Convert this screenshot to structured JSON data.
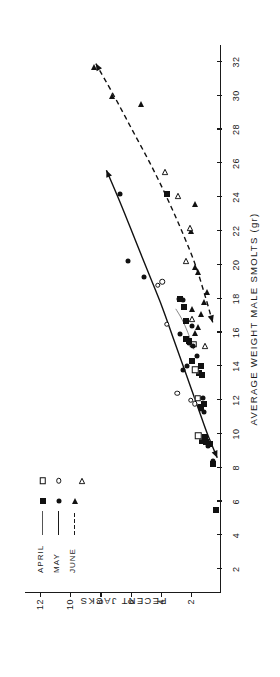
{
  "figure": {
    "y_axis": {
      "label": "PECENT JACKS",
      "ticks": [
        2,
        4,
        6,
        8,
        10,
        12
      ],
      "min": 0,
      "max": 13
    },
    "x_axis": {
      "label": "AVERAGE WEIGHT MALE SMOLTS (gr)",
      "ticks": [
        2,
        4,
        6,
        8,
        10,
        12,
        14,
        16,
        18,
        20,
        22,
        24,
        26,
        28,
        30,
        32
      ],
      "min": 0.6,
      "max": 33
    }
  },
  "legend": {
    "rows": [
      {
        "label": "APRIL",
        "line_style": "thin-solid",
        "open_marker": "open-square",
        "filled_marker": "filled-square"
      },
      {
        "label": "MAY",
        "line_style": "solid",
        "open_marker": "open-circle",
        "filled_marker": "filled-circle"
      },
      {
        "label": "JUNE",
        "line_style": "dashed",
        "open_marker": "open-triangle",
        "filled_marker": "filled-triangle"
      }
    ]
  },
  "chart_data": {
    "type": "scatter",
    "title": "",
    "xlabel": "AVERAGE WEIGHT MALE SMOLTS (gr)",
    "ylabel": "PECENT JACKS",
    "xlim": [
      0.6,
      33
    ],
    "ylim": [
      0,
      13
    ],
    "xticks": [
      2,
      4,
      6,
      8,
      10,
      12,
      14,
      16,
      18,
      20,
      22,
      24,
      26,
      28,
      30,
      32
    ],
    "yticks": [
      2,
      4,
      6,
      8,
      10,
      12
    ],
    "grid": false,
    "legend_position": "upper-left",
    "series": [
      {
        "name": "APRIL",
        "marker": "filled-square",
        "open_marker": "open-square",
        "line": "thin-solid",
        "points": [
          {
            "x": 5.5,
            "y": 0.35,
            "style": "filled-square"
          },
          {
            "x": 8.2,
            "y": 0.55,
            "style": "filled-square"
          },
          {
            "x": 9.4,
            "y": 0.75,
            "style": "filled-square"
          },
          {
            "x": 9.5,
            "y": 1.0,
            "style": "filled-square"
          },
          {
            "x": 9.6,
            "y": 1.25,
            "style": "filled-square"
          },
          {
            "x": 9.8,
            "y": 1.05,
            "style": "filled-square"
          },
          {
            "x": 9.9,
            "y": 1.5,
            "style": "open-square"
          },
          {
            "x": 11.6,
            "y": 1.35,
            "style": "filled-square"
          },
          {
            "x": 11.8,
            "y": 1.1,
            "style": "filled-square"
          },
          {
            "x": 12.1,
            "y": 1.55,
            "style": "open-square"
          },
          {
            "x": 13.5,
            "y": 1.25,
            "style": "filled-square"
          },
          {
            "x": 13.6,
            "y": 1.45,
            "style": "filled-square"
          },
          {
            "x": 13.8,
            "y": 1.7,
            "style": "open-square"
          },
          {
            "x": 14.0,
            "y": 1.3,
            "style": "filled-square"
          },
          {
            "x": 14.3,
            "y": 1.9,
            "style": "filled-square"
          },
          {
            "x": 15.3,
            "y": 1.85,
            "style": "open-square"
          },
          {
            "x": 15.5,
            "y": 2.1,
            "style": "filled-square"
          },
          {
            "x": 15.6,
            "y": 2.35,
            "style": "filled-square"
          },
          {
            "x": 16.7,
            "y": 2.35,
            "style": "filled-square"
          },
          {
            "x": 17.5,
            "y": 2.45,
            "style": "filled-square"
          },
          {
            "x": 18.0,
            "y": 2.75,
            "style": "filled-square"
          },
          {
            "x": 24.2,
            "y": 3.55,
            "style": "filled-square"
          }
        ]
      },
      {
        "name": "MAY",
        "marker": "filled-circle",
        "open_marker": "open-circle",
        "line": "solid",
        "points": [
          {
            "x": 8.4,
            "y": 0.5,
            "style": "filled-circle"
          },
          {
            "x": 9.3,
            "y": 0.85,
            "style": "filled-circle"
          },
          {
            "x": 11.3,
            "y": 1.1,
            "style": "filled-circle"
          },
          {
            "x": 11.5,
            "y": 1.35,
            "style": "filled-circle"
          },
          {
            "x": 11.8,
            "y": 1.75,
            "style": "open-circle"
          },
          {
            "x": 12.0,
            "y": 2.0,
            "style": "open-circle"
          },
          {
            "x": 12.1,
            "y": 1.2,
            "style": "filled-circle"
          },
          {
            "x": 12.4,
            "y": 2.9,
            "style": "open-circle"
          },
          {
            "x": 13.8,
            "y": 2.5,
            "style": "filled-circle"
          },
          {
            "x": 14.0,
            "y": 2.25,
            "style": "filled-circle"
          },
          {
            "x": 14.6,
            "y": 1.6,
            "style": "filled-circle"
          },
          {
            "x": 15.2,
            "y": 1.85,
            "style": "filled-circle"
          },
          {
            "x": 15.4,
            "y": 2.15,
            "style": "filled-circle"
          },
          {
            "x": 15.9,
            "y": 2.7,
            "style": "filled-circle"
          },
          {
            "x": 16.4,
            "y": 1.95,
            "style": "filled-circle"
          },
          {
            "x": 16.5,
            "y": 3.6,
            "style": "open-circle"
          },
          {
            "x": 17.9,
            "y": 2.55,
            "style": "filled-circle"
          },
          {
            "x": 18.0,
            "y": 2.8,
            "style": "filled-circle"
          },
          {
            "x": 18.8,
            "y": 4.2,
            "style": "open-circle"
          },
          {
            "x": 19.0,
            "y": 3.9,
            "style": "open-circle"
          },
          {
            "x": 19.3,
            "y": 5.1,
            "style": "filled-circle"
          },
          {
            "x": 20.2,
            "y": 6.2,
            "style": "filled-circle"
          },
          {
            "x": 24.2,
            "y": 6.7,
            "style": "filled-circle"
          }
        ]
      },
      {
        "name": "JUNE",
        "marker": "filled-triangle",
        "open_marker": "open-triangle",
        "line": "dashed",
        "points": [
          {
            "x": 15.2,
            "y": 1.55,
            "style": "open-triangle"
          },
          {
            "x": 16.0,
            "y": 1.7,
            "style": "filled-triangle"
          },
          {
            "x": 16.3,
            "y": 1.55,
            "style": "filled-triangle"
          },
          {
            "x": 16.8,
            "y": 2.4,
            "style": "open-triangle"
          },
          {
            "x": 17.1,
            "y": 1.3,
            "style": "filled-triangle"
          },
          {
            "x": 17.4,
            "y": 1.9,
            "style": "filled-triangle"
          },
          {
            "x": 17.8,
            "y": 1.1,
            "style": "filled-triangle"
          },
          {
            "x": 18.4,
            "y": 0.95,
            "style": "filled-triangle"
          },
          {
            "x": 19.6,
            "y": 1.5,
            "style": "filled-triangle"
          },
          {
            "x": 19.9,
            "y": 1.75,
            "style": "filled-triangle"
          },
          {
            "x": 20.2,
            "y": 2.8,
            "style": "open-triangle"
          },
          {
            "x": 22.0,
            "y": 2.0,
            "style": "filled-triangle"
          },
          {
            "x": 22.2,
            "y": 2.55,
            "style": "open-triangle"
          },
          {
            "x": 23.6,
            "y": 1.75,
            "style": "filled-triangle"
          },
          {
            "x": 24.1,
            "y": 3.3,
            "style": "open-triangle"
          },
          {
            "x": 25.5,
            "y": 4.2,
            "style": "open-triangle"
          },
          {
            "x": 29.5,
            "y": 5.3,
            "style": "filled-triangle"
          },
          {
            "x": 30.0,
            "y": 7.2,
            "style": "filled-triangle"
          },
          {
            "x": 31.7,
            "y": 8.4,
            "style": "filled-triangle"
          }
        ]
      }
    ],
    "fitted_curves": [
      {
        "name": "MAY",
        "style": "solid",
        "arrow_ends": true,
        "path": [
          [
            8.6,
            0.25
          ],
          [
            10.0,
            0.9
          ],
          [
            11.5,
            1.5
          ],
          [
            13.5,
            2.3
          ],
          [
            15.5,
            3.1
          ],
          [
            17.5,
            3.9
          ],
          [
            19.5,
            4.8
          ],
          [
            21.5,
            5.7
          ],
          [
            23.5,
            6.6
          ],
          [
            25.6,
            7.6
          ]
        ]
      },
      {
        "name": "JUNE",
        "style": "dashed",
        "arrow_ends": true,
        "path": [
          [
            16.6,
            0.55
          ],
          [
            18.0,
            1.0
          ],
          [
            20.0,
            1.7
          ],
          [
            22.0,
            2.6
          ],
          [
            24.0,
            3.6
          ],
          [
            26.0,
            4.7
          ],
          [
            28.0,
            5.9
          ],
          [
            30.0,
            7.1
          ],
          [
            31.9,
            8.3
          ]
        ]
      },
      {
        "name": "APRIL",
        "style": "thin-solid",
        "arrow_ends": false,
        "path": [
          [
            15.0,
            1.8
          ],
          [
            16.0,
            2.2
          ],
          [
            16.8,
            2.6
          ],
          [
            17.4,
            3.0
          ]
        ]
      }
    ]
  }
}
